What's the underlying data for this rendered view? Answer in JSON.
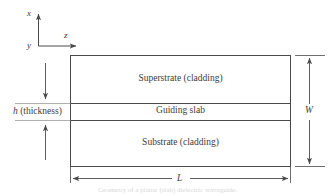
{
  "figure": {
    "type": "slab-waveguide-cross-section",
    "axes": {
      "x_label": "x",
      "y_label": "y",
      "z_label": "z"
    },
    "layers": {
      "superstrate": "Superstrate (cladding)",
      "guiding": "Guiding slab",
      "substrate": "Substrate (cladding)"
    },
    "dimensions": {
      "thickness_label": "h (thickness)",
      "thickness_symbol": "h",
      "thickness_text": "(thickness)",
      "width_label": "W",
      "length_label": "L"
    },
    "caption": "Geometry of a planar (slab) dielectric waveguide.",
    "colors": {
      "line": "#4a4a4a",
      "text": "#3c3c3c",
      "background": "#ffffff"
    }
  }
}
